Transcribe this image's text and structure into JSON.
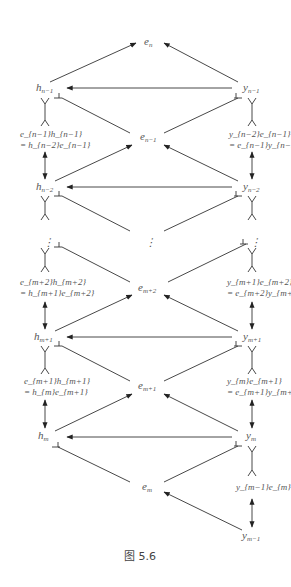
{
  "figure": {
    "caption": "图 5.6",
    "nodes": {
      "e_n": "e",
      "e_n_sub": "n",
      "h_n1": "h",
      "h_n1_sub": "n−1",
      "y_n1": "y",
      "y_n1_sub": "n−1",
      "e_n1": "e",
      "e_n1_sub": "n−1",
      "h_n2": "h",
      "h_n2_sub": "n−2",
      "y_n2": "y",
      "y_n2_sub": "n−2",
      "e_m2": "e",
      "e_m2_sub": "m+2",
      "h_m1": "h",
      "h_m1_sub": "m+1",
      "y_m1": "y",
      "y_m1_sub": "m+1",
      "e_m1": "e",
      "e_m1_sub": "m+1",
      "h_m": "h",
      "h_m_sub": "m",
      "y_m": "y",
      "y_m_sub": "m",
      "e_m": "e",
      "e_m_sub": "m",
      "y_mm1": "y",
      "y_mm1_sub": "m−1",
      "vdots": "⋮"
    },
    "relations": {
      "left_top_1": "e_{n−1}h_{n−1}",
      "left_top_2": "= h_{n−2}e_{n−1}",
      "right_top_1": "y_{n−2}e_{n−1}",
      "right_top_2": "= e_{n−1}y_{n−1}",
      "left_mid_1": "e_{m+2}h_{m+2}",
      "left_mid_2": "= h_{m+1}e_{m+2}",
      "right_mid_1": "y_{m+1}e_{m+2}",
      "right_mid_2": "= e_{m+2}y_{m+2}",
      "left_low_1": "e_{m+1}h_{m+1}",
      "left_low_2": "= h_{m}e_{m+1}",
      "right_low_1": "y_{m}e_{m+1}",
      "right_low_2": "= e_{m+1}y_{m+1}",
      "right_bottom": "y_{m−1}e_{m}"
    }
  }
}
